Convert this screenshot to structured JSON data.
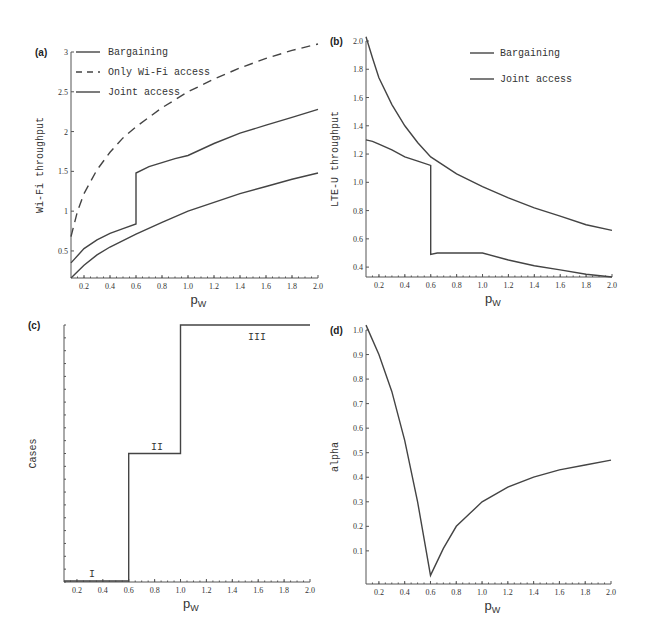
{
  "chart_data": [
    {
      "panel": "(a)",
      "type": "line",
      "xlabel": "p_W",
      "ylabel": "Wi-Fi throughput",
      "xlim": [
        0.1,
        2.0
      ],
      "ylim": [
        0.16,
        3.0
      ],
      "xticks": [
        "0.2",
        "0.4",
        "0.6",
        "0.8",
        "1.0",
        "1.2",
        "1.4",
        "1.6",
        "1.8",
        "2.0"
      ],
      "yticks": [
        "0.5",
        "1",
        "1.5",
        "2",
        "2.5",
        "3"
      ],
      "legend": [
        "Bargaining",
        "Only Wi-Fi access",
        "Joint access"
      ],
      "legend_position": "upper left",
      "series": [
        {
          "name": "Bargaining",
          "style": "solid",
          "x": [
            0.1,
            0.2,
            0.3,
            0.4,
            0.5,
            0.6,
            0.6,
            0.7,
            0.8,
            0.9,
            1.0,
            1.2,
            1.4,
            1.6,
            1.8,
            2.0
          ],
          "y": [
            0.35,
            0.53,
            0.64,
            0.72,
            0.78,
            0.84,
            1.48,
            1.56,
            1.61,
            1.66,
            1.7,
            1.85,
            1.98,
            2.08,
            2.18,
            2.28
          ]
        },
        {
          "name": "Only Wi-Fi access",
          "style": "dashed",
          "x": [
            0.1,
            0.15,
            0.2,
            0.3,
            0.4,
            0.5,
            0.6,
            0.8,
            1.0,
            1.2,
            1.4,
            1.6,
            1.8,
            2.0
          ],
          "y": [
            0.68,
            1.0,
            1.22,
            1.52,
            1.74,
            1.92,
            2.06,
            2.3,
            2.5,
            2.66,
            2.8,
            2.92,
            3.02,
            3.1
          ]
        },
        {
          "name": "Joint access",
          "style": "solid",
          "x": [
            0.1,
            0.2,
            0.3,
            0.4,
            0.5,
            0.6,
            0.8,
            1.0,
            1.2,
            1.4,
            1.6,
            1.8,
            2.0
          ],
          "y": [
            0.16,
            0.32,
            0.45,
            0.55,
            0.63,
            0.71,
            0.86,
            1.0,
            1.11,
            1.22,
            1.31,
            1.4,
            1.48
          ]
        }
      ]
    },
    {
      "panel": "(b)",
      "type": "line",
      "xlabel": "p_W",
      "ylabel": "LTE-U throughput",
      "xlim": [
        0.1,
        2.0
      ],
      "ylim": [
        0.33,
        2.0
      ],
      "xticks": [
        "0.2",
        "0.4",
        "0.6",
        "0.8",
        "1.0",
        "1.2",
        "1.4",
        "1.6",
        "1.8",
        "2.0"
      ],
      "yticks": [
        "0.4",
        "0.6",
        "0.8",
        "1.0",
        "1.2",
        "1.4",
        "1.6",
        "1.8",
        "2.0"
      ],
      "legend": [
        "Bargaining",
        "Joint access"
      ],
      "legend_position": "upper right",
      "series": [
        {
          "name": "Bargaining",
          "style": "solid",
          "x": [
            0.1,
            0.15,
            0.2,
            0.3,
            0.4,
            0.5,
            0.6,
            0.6,
            0.65,
            0.8,
            1.0,
            1.2,
            1.4,
            1.6,
            1.8,
            2.0
          ],
          "y": [
            1.3,
            1.29,
            1.27,
            1.23,
            1.18,
            1.15,
            1.12,
            0.49,
            0.5,
            0.5,
            0.5,
            0.45,
            0.41,
            0.38,
            0.35,
            0.33
          ]
        },
        {
          "name": "Joint access",
          "style": "solid",
          "x": [
            0.1,
            0.15,
            0.2,
            0.3,
            0.4,
            0.5,
            0.6,
            0.8,
            1.0,
            1.2,
            1.4,
            1.6,
            1.8,
            2.0
          ],
          "y": [
            2.03,
            1.88,
            1.74,
            1.55,
            1.4,
            1.28,
            1.18,
            1.06,
            0.97,
            0.89,
            0.82,
            0.76,
            0.7,
            0.66
          ]
        }
      ]
    },
    {
      "panel": "(c)",
      "type": "line",
      "xlabel": "p_W",
      "ylabel": "Cases",
      "xlim": [
        0.1,
        2.0
      ],
      "xticks": [
        "0.2",
        "0.4",
        "0.6",
        "0.8",
        "1.0",
        "1.2",
        "1.4",
        "1.6",
        "1.8",
        "2.0"
      ],
      "yticks": [],
      "annotations": [
        "I",
        "II",
        "III"
      ],
      "series": [
        {
          "name": "Cases",
          "style": "step",
          "x": [
            0.1,
            0.6,
            0.6,
            1.0,
            1.0,
            2.0
          ],
          "y": [
            1,
            1,
            2,
            2,
            3,
            3
          ]
        }
      ]
    },
    {
      "panel": "(d)",
      "type": "line",
      "xlabel": "p_W",
      "ylabel": "alpha",
      "xlim": [
        0.1,
        2.0
      ],
      "ylim": [
        0.0,
        1.0
      ],
      "xticks": [
        "0.2",
        "0.4",
        "0.6",
        "0.8",
        "1.0",
        "1.2",
        "1.4",
        "1.6",
        "1.8",
        "2.0"
      ],
      "yticks": [
        "0.1",
        "0.2",
        "0.3",
        "0.4",
        "0.5",
        "0.6",
        "0.7",
        "0.8",
        "0.9",
        "1.0"
      ],
      "series": [
        {
          "name": "alpha",
          "style": "solid",
          "x": [
            0.1,
            0.2,
            0.3,
            0.4,
            0.5,
            0.6,
            0.7,
            0.8,
            0.9,
            1.0,
            1.2,
            1.4,
            1.6,
            1.8,
            2.0
          ],
          "y": [
            1.02,
            0.9,
            0.75,
            0.55,
            0.3,
            0.0,
            0.11,
            0.2,
            0.25,
            0.3,
            0.36,
            0.4,
            0.43,
            0.45,
            0.47
          ]
        }
      ]
    }
  ],
  "labels": {
    "a": "(a)",
    "b": "(b)",
    "c": "(c)",
    "d": "(d)",
    "xlabel_main": "p",
    "xlabel_sub": "W",
    "ylabel_a": "Wi-Fi throughput",
    "ylabel_b": "LTE-U throughput",
    "ylabel_c": "Cases",
    "ylabel_d": "alpha",
    "legend_a": [
      "Bargaining",
      "Only Wi-Fi access",
      "Joint access"
    ],
    "legend_b": [
      "Bargaining",
      "Joint access"
    ],
    "case_I": "I",
    "case_II": "II",
    "case_III": "III"
  }
}
